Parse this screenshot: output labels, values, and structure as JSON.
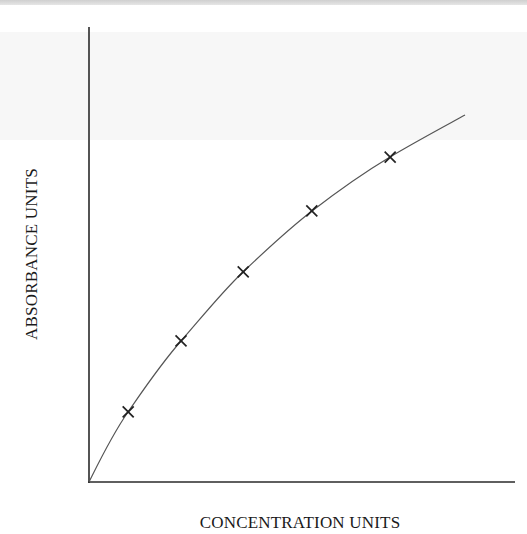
{
  "chart_data": {
    "type": "scatter",
    "title": "",
    "xlabel": "CONCENTRATION UNITS",
    "ylabel": "ABSORBANCE UNITS",
    "xlim": [
      0,
      10
    ],
    "ylim": [
      0,
      10
    ],
    "grid": false,
    "legend": null,
    "tick_labels": false,
    "series": [
      {
        "name": "measured points",
        "marker": "x",
        "x": [
          0.92,
          2.16,
          3.62,
          5.23,
          7.07
        ],
        "y": [
          1.54,
          3.1,
          4.62,
          5.96,
          7.14
        ]
      },
      {
        "name": "calibration curve",
        "style": "line",
        "x": [
          0,
          0.92,
          2.16,
          3.62,
          5.23,
          7.07,
          8.83
        ],
        "y": [
          0,
          1.54,
          3.1,
          4.62,
          5.96,
          7.14,
          8.07
        ]
      }
    ]
  },
  "axes": {
    "x_label": "CONCENTRATION UNITS",
    "y_label": "ABSORBANCE UNITS"
  },
  "colors": {
    "axis": "#2a2a2a",
    "curve": "#555555",
    "marker": "#222222",
    "label": "#1a1a1a"
  }
}
